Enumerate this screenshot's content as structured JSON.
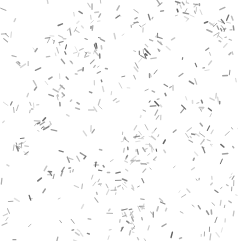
{
  "image": {
    "description": "Speckle texture: scattered short grey rod-shaped marks at random orientations on a white background",
    "background_color": "#ffffff",
    "mark_colors": [
      "#5a5a5a",
      "#6e6e6e",
      "#808080",
      "#959595",
      "#a8a8a8",
      "#c4c4c4"
    ],
    "mark_shape": "rod",
    "mark_count": 520,
    "seed": 20240611
  }
}
